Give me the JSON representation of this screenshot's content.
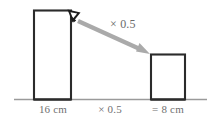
{
  "figure": {
    "kind": "bar-scaling-diagram",
    "colors": {
      "bar_stroke": "#2b2b2b",
      "baseline": "#9a9a9a",
      "arrow": "#a8a8a8",
      "pointer": "#1a1a1a",
      "text": "#6f6f6f",
      "background": "#ffffff"
    },
    "bars": [
      {
        "name": "tall-bar",
        "label": "16 cm",
        "value": 16,
        "unit": "cm"
      },
      {
        "name": "short-bar",
        "label": "= 8 cm",
        "value": 8,
        "unit": "cm"
      }
    ],
    "operation": {
      "arrow_label": "× 0.5",
      "baseline_label": "× 0.5",
      "factor": 0.5
    },
    "icons": {
      "pointer": "cursor-arrow-icon",
      "arrow": "scale-arrow-icon"
    }
  }
}
